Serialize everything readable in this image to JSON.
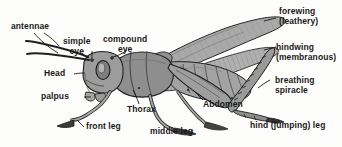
{
  "figure": {
    "style": "grayscale-line-drawing",
    "width": 342,
    "height": 147,
    "colors": {
      "background": "#fdfdfc",
      "outline": "#1a1a1a",
      "body_fill": "#9a9a9a",
      "body_fill_light": "#bdbdbd",
      "body_fill_dark": "#7a7a7a",
      "wing_fill": "#a8a8a8",
      "label_text": "#1a1a1a"
    }
  },
  "labels": [
    {
      "id": "antennae",
      "text": "antennae",
      "line2": ""
    },
    {
      "id": "simple-eye",
      "text": "simple",
      "line2": "eye"
    },
    {
      "id": "compound-eye",
      "text": "compound",
      "line2": "eye"
    },
    {
      "id": "head",
      "text": "Head",
      "line2": ""
    },
    {
      "id": "palpus",
      "text": "palpus",
      "line2": ""
    },
    {
      "id": "front-leg",
      "text": "front leg",
      "line2": ""
    },
    {
      "id": "thorax",
      "text": "Thorax",
      "line2": ""
    },
    {
      "id": "middle-leg",
      "text": "middle leg",
      "line2": ""
    },
    {
      "id": "abdomen",
      "text": "Abdomen",
      "line2": ""
    },
    {
      "id": "forewing",
      "text": "forewing",
      "line2": "(leathery)"
    },
    {
      "id": "hindwing",
      "text": "hindwing",
      "line2": "(membranous)"
    },
    {
      "id": "breathing-spiracle",
      "text": "breathing",
      "line2": "spiracle"
    },
    {
      "id": "hind-leg",
      "text": "hind (jumping) leg",
      "line2": ""
    }
  ]
}
